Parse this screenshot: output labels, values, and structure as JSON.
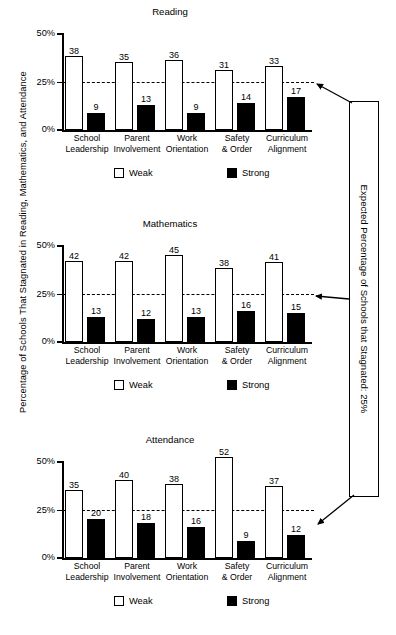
{
  "axis": {
    "y_title": "Percentage of Schools That Stagnated in Reading, Mathematics, and Attendance",
    "ticks": [
      "50%",
      "25%",
      "0%"
    ]
  },
  "legend": {
    "weak": "Weak",
    "strong": "Strong"
  },
  "callout": {
    "text": "Expected Percentage of Schools that Stagnated: 25%"
  },
  "categories": [
    "School\nLeadership",
    "Parent\nInvolvement",
    "Work\nOrientation",
    "Safety\n& Order",
    "Curriculum\nAlignment"
  ],
  "panels": [
    {
      "title": "Reading",
      "weak": [
        38,
        35,
        36,
        31,
        33
      ],
      "strong": [
        9,
        13,
        9,
        14,
        17
      ]
    },
    {
      "title": "Mathematics",
      "weak": [
        42,
        42,
        45,
        38,
        41
      ],
      "strong": [
        13,
        12,
        13,
        16,
        15
      ]
    },
    {
      "title": "Attendance",
      "weak": [
        35,
        40,
        38,
        52,
        37
      ],
      "strong": [
        20,
        18,
        16,
        9,
        12
      ]
    }
  ],
  "chart_data": {
    "type": "bar",
    "title": "Percentage of Schools That Stagnated in Reading, Mathematics, and Attendance",
    "xlabel": "",
    "ylabel": "Percentage of Schools That Stagnated in Reading, Mathematics, and Attendance",
    "ylim": [
      0,
      50
    ],
    "yticks": [
      0,
      25,
      50
    ],
    "ytick_labels": [
      "0%",
      "25%",
      "50%"
    ],
    "grid": false,
    "legend_position": "bottom",
    "legend_entries": [
      "Weak",
      "Strong"
    ],
    "categories": [
      "School Leadership",
      "Parent Involvement",
      "Work Orientation",
      "Safety & Order",
      "Curriculum Alignment"
    ],
    "annotations": [
      {
        "type": "reference-line",
        "value": 25,
        "style": "dashed",
        "label": "Expected Percentage of Schools that Stagnated: 25%"
      }
    ],
    "panels": [
      {
        "title": "Reading",
        "series": [
          {
            "name": "Weak",
            "values": [
              38,
              35,
              36,
              31,
              33
            ]
          },
          {
            "name": "Strong",
            "values": [
              9,
              13,
              9,
              14,
              17
            ]
          }
        ]
      },
      {
        "title": "Mathematics",
        "series": [
          {
            "name": "Weak",
            "values": [
              42,
              42,
              45,
              38,
              41
            ]
          },
          {
            "name": "Strong",
            "values": [
              13,
              12,
              13,
              16,
              15
            ]
          }
        ]
      },
      {
        "title": "Attendance",
        "series": [
          {
            "name": "Weak",
            "values": [
              35,
              40,
              38,
              52,
              37
            ]
          },
          {
            "name": "Strong",
            "values": [
              20,
              18,
              16,
              9,
              12
            ]
          }
        ]
      }
    ]
  }
}
